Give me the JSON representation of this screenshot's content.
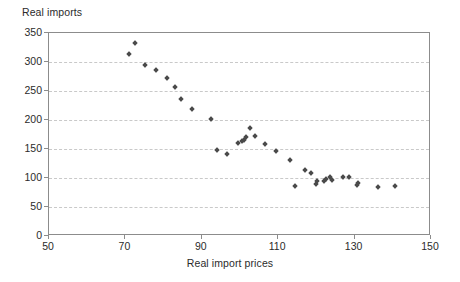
{
  "chart_data": {
    "type": "scatter",
    "title": "",
    "ylabel": "Real imports",
    "xlabel": "Real import prices",
    "xlim": [
      50,
      150
    ],
    "ylim": [
      0,
      350
    ],
    "xticks": [
      50,
      70,
      90,
      110,
      130,
      150
    ],
    "yticks": [
      0,
      50,
      100,
      150,
      200,
      250,
      300,
      350
    ],
    "grid": "horizontal-dashed",
    "legend": "none",
    "marker": "diamond",
    "marker_color": "#4a4a4a",
    "series": [
      {
        "name": "Real imports vs real import prices",
        "points": [
          [
            71.0,
            313
          ],
          [
            72.5,
            332
          ],
          [
            75.0,
            295
          ],
          [
            78.0,
            287
          ],
          [
            81.0,
            272
          ],
          [
            83.0,
            257
          ],
          [
            84.5,
            237
          ],
          [
            87.5,
            219
          ],
          [
            92.5,
            201
          ],
          [
            94.0,
            149
          ],
          [
            96.5,
            141
          ],
          [
            99.5,
            160
          ],
          [
            100.5,
            163
          ],
          [
            101.0,
            166
          ],
          [
            101.5,
            170
          ],
          [
            102.5,
            186
          ],
          [
            104.0,
            172
          ],
          [
            106.5,
            158
          ],
          [
            109.5,
            146
          ],
          [
            113.0,
            131
          ],
          [
            114.5,
            86
          ],
          [
            117.0,
            113
          ],
          [
            118.5,
            108
          ],
          [
            120.0,
            90
          ],
          [
            120.2,
            95
          ],
          [
            122.0,
            94
          ],
          [
            122.5,
            99
          ],
          [
            123.5,
            101
          ],
          [
            124.0,
            97
          ],
          [
            127.0,
            102
          ],
          [
            128.5,
            102
          ],
          [
            130.5,
            88
          ],
          [
            131.0,
            92
          ],
          [
            136.0,
            85
          ],
          [
            140.5,
            86
          ]
        ]
      }
    ]
  },
  "axes": {
    "y_title": "Real imports",
    "x_title": "Real import prices",
    "y_tick_labels": [
      "350",
      "300",
      "250",
      "200",
      "150",
      "100",
      "50",
      "0"
    ],
    "x_tick_labels": [
      "50",
      "70",
      "90",
      "110",
      "130",
      "150"
    ]
  }
}
